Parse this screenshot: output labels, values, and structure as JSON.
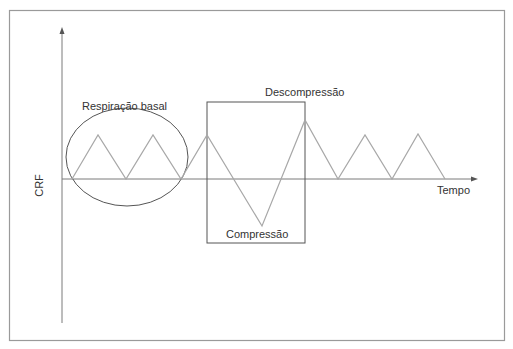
{
  "diagram": {
    "y_axis_label": "CRF",
    "x_axis_label": "Tempo",
    "annotations": {
      "basal": "Respiração basal",
      "decompression": "Descompressão",
      "compression": "Compressão"
    },
    "colors": {
      "frame": "#9a9a9a",
      "axes": "#7a7a7a",
      "waveform": "#a8a8a8",
      "shapes": "#555555",
      "text": "#333333"
    },
    "waveform_points": [
      [
        72,
        179
      ],
      [
        98,
        135
      ],
      [
        126,
        179
      ],
      [
        153,
        135
      ],
      [
        181,
        179
      ],
      [
        207,
        135
      ],
      [
        262,
        226
      ],
      [
        305,
        120
      ],
      [
        338,
        179
      ],
      [
        365,
        135
      ],
      [
        392,
        179
      ],
      [
        418,
        134
      ],
      [
        445,
        179
      ]
    ]
  }
}
